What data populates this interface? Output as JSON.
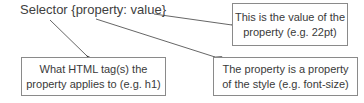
{
  "syntax": {
    "text": "Selector {property: value}"
  },
  "callouts": {
    "value": {
      "line1": "This is the value of the",
      "line2": "property (e.g. 22pt)"
    },
    "selector": {
      "line1": "What HTML tag(s) the",
      "line2": "property applies to (e.g. h1)"
    },
    "property": {
      "line1": "The property is a property",
      "line2": "of the style (e.g. font-size)"
    }
  },
  "colors": {
    "text": "#404040",
    "border": "#8a8a8a",
    "arrow": "#555555",
    "background": "#ffffff"
  }
}
